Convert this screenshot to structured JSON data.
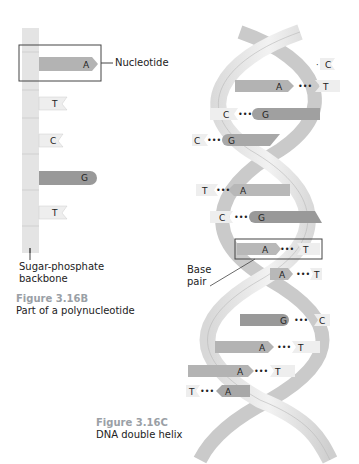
{
  "figure_b": {
    "number": "Figure 3.16B",
    "caption": "Part of a polynucleotide",
    "callout_nucleotide": "Nucleotide",
    "callout_backbone_line1": "Sugar-phosphate",
    "callout_backbone_line2": "backbone",
    "bases": [
      "A",
      "T",
      "C",
      "G",
      "T"
    ]
  },
  "figure_c": {
    "number": "Figure 3.16C",
    "caption": "DNA double helix",
    "callout_base_pair_line1": "Base",
    "callout_base_pair_line2": "pair",
    "base_pairs": [
      {
        "left": "",
        "right": "C"
      },
      {
        "left": "A",
        "right": "T"
      },
      {
        "left": "C",
        "right": "G"
      },
      {
        "left": "C",
        "right": "G"
      },
      {
        "left": "T",
        "right": "A"
      },
      {
        "left": "C",
        "right": "G"
      },
      {
        "left": "A",
        "right": "T"
      },
      {
        "left": "A",
        "right": "T"
      },
      {
        "left": "G",
        "right": "C"
      },
      {
        "left": "A",
        "right": "T"
      },
      {
        "left": "A",
        "right": "T"
      },
      {
        "left": "T",
        "right": "A"
      }
    ],
    "dots": "•••"
  },
  "colors": {
    "backbone": "#e6e6e6",
    "purine_dark": "#a8a8a8",
    "purine_mid": "#c4c4c4",
    "pyrimidine_light": "#eeeeee",
    "outline": "#555555"
  }
}
